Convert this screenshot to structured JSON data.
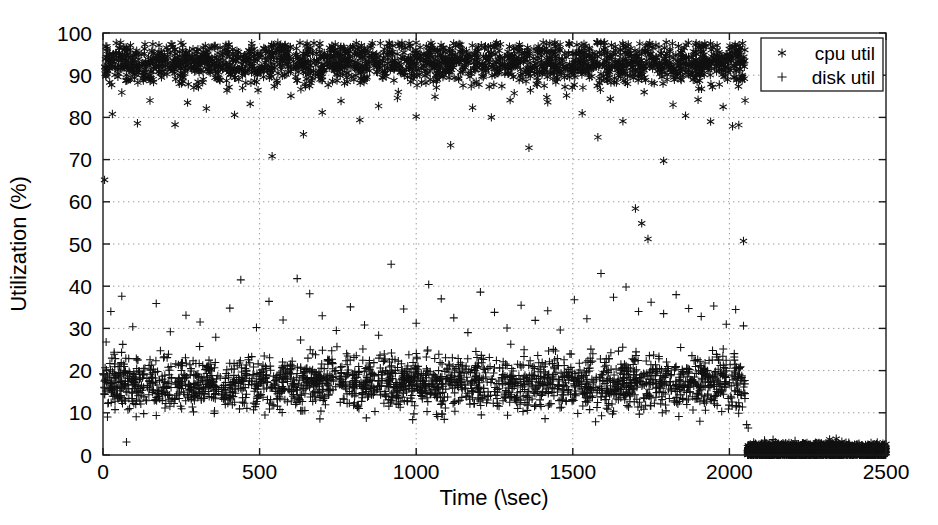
{
  "chart_data": {
    "type": "scatter",
    "title": "",
    "xlabel": "Time (\\sec)",
    "ylabel": "Utilization (%)",
    "xlim": [
      0,
      2500
    ],
    "ylim": [
      0,
      100
    ],
    "xticks": [
      0,
      500,
      1000,
      1500,
      2000,
      2500
    ],
    "yticks": [
      0,
      10,
      20,
      30,
      40,
      50,
      60,
      70,
      80,
      90,
      100
    ],
    "xtick_labels": [
      "0",
      "500",
      "1000",
      "1500",
      "2000",
      "2500"
    ],
    "ytick_labels": [
      "0",
      "10",
      "20",
      "30",
      "40",
      "50",
      "60",
      "70",
      "80",
      "90",
      "100"
    ],
    "grid": true,
    "grid_style": "dotted",
    "legend_position": "top-right",
    "series": [
      {
        "name": "cpu util",
        "marker": "asterisk",
        "color": "#111111",
        "description": "CPU utilization stays in a dense band near 90-97% from t=0 to t~2050 with sparse low outliers between 50% and 88%, then collapses to ~0-2% for t>2050 until t=2500.",
        "active_range": [
          0,
          2050
        ],
        "band_mean": 93,
        "band_low": 89,
        "band_high": 97,
        "idle_value": 1,
        "outliers": [
          [
            5,
            65.2
          ],
          [
            30,
            80.8
          ],
          [
            60,
            85.9
          ],
          [
            110,
            78.6
          ],
          [
            150,
            84.0
          ],
          [
            230,
            78.3
          ],
          [
            270,
            83.5
          ],
          [
            330,
            82.1
          ],
          [
            420,
            80.6
          ],
          [
            470,
            83.2
          ],
          [
            540,
            70.8
          ],
          [
            600,
            85.1
          ],
          [
            640,
            76.0
          ],
          [
            700,
            81.2
          ],
          [
            760,
            83.9
          ],
          [
            820,
            79.4
          ],
          [
            880,
            82.7
          ],
          [
            940,
            84.6
          ],
          [
            1000,
            80.2
          ],
          [
            1060,
            84.9
          ],
          [
            1110,
            73.4
          ],
          [
            1180,
            82.3
          ],
          [
            1240,
            80.0
          ],
          [
            1300,
            84.1
          ],
          [
            1360,
            72.8
          ],
          [
            1420,
            83.6
          ],
          [
            1480,
            85.2
          ],
          [
            1530,
            81.0
          ],
          [
            1580,
            75.3
          ],
          [
            1620,
            84.4
          ],
          [
            1660,
            79.1
          ],
          [
            1700,
            58.4
          ],
          [
            1720,
            54.9
          ],
          [
            1740,
            51.2
          ],
          [
            1790,
            69.7
          ],
          [
            1820,
            83.0
          ],
          [
            1860,
            80.4
          ],
          [
            1900,
            84.2
          ],
          [
            1940,
            79.0
          ],
          [
            1980,
            82.5
          ],
          [
            2010,
            77.9
          ],
          [
            2030,
            78.2
          ],
          [
            2045,
            50.7
          ],
          [
            2050,
            84.0
          ]
        ]
      },
      {
        "name": "disk util",
        "marker": "plus",
        "color": "#111111",
        "description": "Disk utilization forms a dense band around 14-22% from t=0 to t~2050 with frequent upward outliers reaching 30-45%, then drops to ~0-2% for t>2050 until t=2500.",
        "active_range": [
          0,
          2050
        ],
        "band_mean": 17,
        "band_low": 13,
        "band_high": 23,
        "idle_value": 1,
        "outliers": [
          [
            10,
            26.8
          ],
          [
            25,
            34.0
          ],
          [
            60,
            37.6
          ],
          [
            75,
            3.1
          ],
          [
            95,
            30.4
          ],
          [
            130,
            9.8
          ],
          [
            170,
            35.9
          ],
          [
            215,
            29.2
          ],
          [
            265,
            33.1
          ],
          [
            310,
            31.5
          ],
          [
            360,
            27.9
          ],
          [
            405,
            34.8
          ],
          [
            440,
            41.5
          ],
          [
            490,
            30.2
          ],
          [
            530,
            36.4
          ],
          [
            575,
            32.0
          ],
          [
            620,
            41.8
          ],
          [
            660,
            38.2
          ],
          [
            700,
            33.0
          ],
          [
            745,
            29.5
          ],
          [
            790,
            35.1
          ],
          [
            835,
            30.8
          ],
          [
            880,
            28.4
          ],
          [
            920,
            45.2
          ],
          [
            960,
            34.6
          ],
          [
            1000,
            31.2
          ],
          [
            1040,
            40.4
          ],
          [
            1080,
            37.0
          ],
          [
            1120,
            32.5
          ],
          [
            1165,
            29.0
          ],
          [
            1205,
            38.6
          ],
          [
            1250,
            33.8
          ],
          [
            1290,
            30.1
          ],
          [
            1335,
            35.5
          ],
          [
            1380,
            31.9
          ],
          [
            1420,
            34.2
          ],
          [
            1460,
            29.6
          ],
          [
            1505,
            36.8
          ],
          [
            1545,
            32.3
          ],
          [
            1590,
            43.0
          ],
          [
            1630,
            37.4
          ],
          [
            1670,
            39.8
          ],
          [
            1710,
            34.0
          ],
          [
            1750,
            36.2
          ],
          [
            1790,
            33.5
          ],
          [
            1830,
            38.0
          ],
          [
            1870,
            34.7
          ],
          [
            1910,
            32.8
          ],
          [
            1950,
            35.3
          ],
          [
            1990,
            31.0
          ],
          [
            2020,
            34.5
          ],
          [
            2045,
            30.6
          ],
          [
            2055,
            7.2
          ],
          [
            2060,
            6.4
          ]
        ]
      }
    ]
  },
  "legend": {
    "entries": [
      {
        "label": "cpu util",
        "marker": "asterisk"
      },
      {
        "label": "disk util",
        "marker": "plus"
      }
    ]
  },
  "axes": {
    "x_title": "Time (\\sec)",
    "y_title": "Utilization (%)"
  }
}
